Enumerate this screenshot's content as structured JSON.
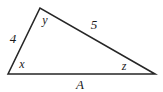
{
  "figure": {
    "background_color": "#ffffff",
    "stroke_color": "#262626",
    "stroke_width": 1.6,
    "width": 163,
    "height": 92,
    "vertices": {
      "left": {
        "name": "left-vertex",
        "x": 8,
        "y": 74
      },
      "apex": {
        "name": "apex-vertex",
        "x": 40,
        "y": 8
      },
      "right": {
        "name": "right-vertex",
        "x": 155,
        "y": 74
      }
    },
    "labels": {
      "side_left": {
        "text": "4",
        "x": 13,
        "y": 38,
        "kind": "side-length"
      },
      "side_top_right": {
        "text": "5",
        "x": 94,
        "y": 24,
        "kind": "side-length"
      },
      "side_base": {
        "text": "A",
        "x": 80,
        "y": 84,
        "kind": "base-name"
      },
      "angle_left": {
        "text": "x",
        "x": 22,
        "y": 64,
        "kind": "angle-name"
      },
      "angle_apex": {
        "text": "y",
        "x": 45,
        "y": 20,
        "kind": "angle-name"
      },
      "angle_right": {
        "text": "z",
        "x": 124,
        "y": 66,
        "kind": "angle-name"
      }
    }
  }
}
